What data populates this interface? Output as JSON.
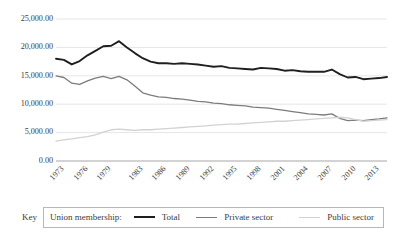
{
  "chart_data": {
    "type": "line",
    "title": "",
    "xlabel": "",
    "ylabel": "",
    "ylim": [
      0,
      25000
    ],
    "ytick_values": [
      0,
      5000,
      10000,
      15000,
      20000,
      25000
    ],
    "ytick_labels": [
      "0.00",
      "5,000.00",
      "10,000.00",
      "15,000.00",
      "20,000.00",
      "25,000.00"
    ],
    "grid": true,
    "legend_position": "bottom",
    "x": [
      1973,
      1974,
      1975,
      1976,
      1977,
      1978,
      1979,
      1980,
      1981,
      1982,
      1983,
      1984,
      1985,
      1986,
      1987,
      1988,
      1989,
      1990,
      1991,
      1992,
      1993,
      1994,
      1995,
      1996,
      1997,
      1998,
      1999,
      2000,
      2001,
      2002,
      2003,
      2004,
      2005,
      2006,
      2007,
      2008,
      2009,
      2010,
      2011,
      2012,
      2013,
      2014,
      2015
    ],
    "xtick_labels": [
      "1973",
      "1976",
      "1979",
      "1983",
      "1986",
      "1989",
      "1992",
      "1995",
      "1998",
      "2001",
      "2004",
      "2007",
      "2010",
      "2013"
    ],
    "xtick_years": [
      1973,
      1976,
      1979,
      1983,
      1986,
      1989,
      1992,
      1995,
      1998,
      2001,
      2004,
      2007,
      2010,
      2013
    ],
    "series": [
      {
        "name": "Total",
        "color": "#1f1f1f",
        "width": 1.9,
        "values": [
          18000,
          17800,
          17000,
          17600,
          18600,
          19400,
          20200,
          20300,
          21100,
          20000,
          19000,
          18100,
          17500,
          17200,
          17200,
          17100,
          17200,
          17100,
          17000,
          16800,
          16600,
          16700,
          16400,
          16300,
          16200,
          16100,
          16400,
          16300,
          16200,
          15900,
          16000,
          15800,
          15700,
          15700,
          15700,
          16100,
          15300,
          14700,
          14800,
          14400,
          14500,
          14600,
          14800
        ]
      },
      {
        "name": "Private sector",
        "color": "#7c7c7c",
        "width": 1.3,
        "values": [
          15000,
          14700,
          13700,
          13500,
          14100,
          14600,
          14900,
          14500,
          14900,
          14300,
          13200,
          12000,
          11600,
          11300,
          11200,
          11000,
          10900,
          10700,
          10500,
          10400,
          10200,
          10100,
          9900,
          9800,
          9700,
          9500,
          9400,
          9300,
          9100,
          8900,
          8700,
          8500,
          8300,
          8200,
          8100,
          8300,
          7500,
          7100,
          7200,
          7100,
          7300,
          7400,
          7600
        ]
      },
      {
        "name": "Public sector",
        "color": "#d2d2d2",
        "width": 1.3,
        "values": [
          3500,
          3700,
          3900,
          4100,
          4300,
          4600,
          5100,
          5500,
          5600,
          5500,
          5400,
          5500,
          5500,
          5600,
          5700,
          5800,
          5900,
          6000,
          6100,
          6200,
          6300,
          6400,
          6500,
          6500,
          6600,
          6700,
          6800,
          6900,
          7000,
          7000,
          7100,
          7200,
          7300,
          7400,
          7500,
          7600,
          7700,
          7600,
          7300,
          7000,
          7100,
          7200,
          7300
        ]
      }
    ]
  },
  "key": {
    "label": "Key",
    "legend_title": "Union membership:",
    "entries": [
      {
        "label": "Total",
        "color": "#1f1f1f",
        "thickness": 2
      },
      {
        "label": "Private sector",
        "color": "#7c7c7c",
        "thickness": 1
      },
      {
        "label": "Public sector",
        "color": "#d2d2d2",
        "thickness": 1
      }
    ]
  },
  "colors": {
    "gridline": "#e6e6e6",
    "axis": "#a6a6a6",
    "text": "#3c3c3c",
    "legend_border": "#b7b7b7"
  }
}
